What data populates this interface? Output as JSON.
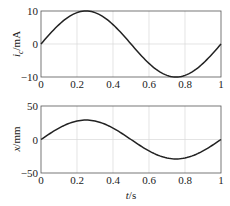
{
  "chart_data": [
    {
      "type": "line",
      "title": "",
      "xlabel": "",
      "ylabel": "i_c/mA",
      "ylabel_main": "i",
      "ylabel_sub": "c",
      "ylabel_unit": "/mA",
      "xlim": [
        0,
        1
      ],
      "ylim": [
        -10,
        10
      ],
      "xticks": [
        "0",
        "0.2",
        "0.4",
        "0.6",
        "0.8",
        "1"
      ],
      "yticks": [
        "10",
        "0",
        "−10"
      ],
      "grid": true,
      "series": [
        {
          "name": "i_c",
          "color": "#222222",
          "x": [
            0,
            0.05,
            0.1,
            0.15,
            0.2,
            0.25,
            0.3,
            0.35,
            0.4,
            0.45,
            0.5,
            0.55,
            0.6,
            0.65,
            0.7,
            0.75,
            0.8,
            0.85,
            0.9,
            0.95,
            1
          ],
          "y": [
            0,
            3.09,
            5.88,
            8.09,
            9.51,
            10,
            9.51,
            8.09,
            5.88,
            3.09,
            0,
            -3.09,
            -5.88,
            -8.09,
            -9.51,
            -10,
            -9.51,
            -8.09,
            -5.88,
            -3.09,
            0
          ]
        }
      ]
    },
    {
      "type": "line",
      "title": "",
      "xlabel": "t/s",
      "xlabel_main": "t",
      "xlabel_unit": "/s",
      "ylabel": "x/mm",
      "ylabel_main": "x",
      "ylabel_unit": "/mm",
      "xlim": [
        0,
        1
      ],
      "ylim": [
        -50,
        50
      ],
      "xticks": [
        "0",
        "0.2",
        "0.4",
        "0.6",
        "0.8",
        "1"
      ],
      "yticks": [
        "50",
        "0",
        "−50"
      ],
      "grid": true,
      "series": [
        {
          "name": "x",
          "color": "#222222",
          "x": [
            0,
            0.05,
            0.1,
            0.15,
            0.2,
            0.25,
            0.3,
            0.35,
            0.4,
            0.45,
            0.5,
            0.55,
            0.6,
            0.65,
            0.7,
            0.75,
            0.8,
            0.85,
            0.9,
            0.95,
            1
          ],
          "y": [
            0,
            9.0,
            17.1,
            23.5,
            27.6,
            29,
            27.6,
            23.5,
            17.1,
            9.0,
            0,
            -9.0,
            -17.1,
            -23.5,
            -27.6,
            -29,
            -27.6,
            -23.5,
            -17.1,
            -9.0,
            0
          ]
        }
      ]
    }
  ]
}
